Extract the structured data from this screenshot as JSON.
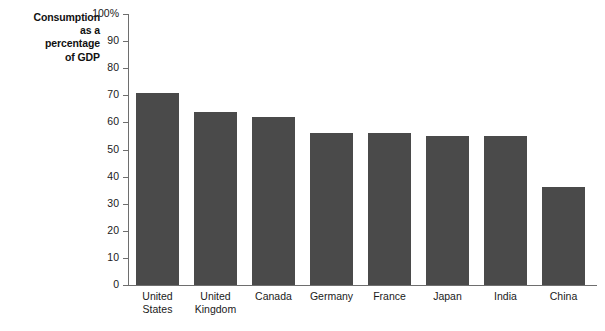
{
  "chart_data": {
    "type": "bar",
    "title": "Consumption as a percentage of GDP",
    "title_lines": [
      "Consumption",
      "as a",
      "percentage",
      "of GDP"
    ],
    "xlabel": "",
    "ylabel": "",
    "ylim": [
      0,
      100
    ],
    "grid": false,
    "legend": "none",
    "bar_color": "#4a4a4a",
    "axis_color": "#6e6e6e",
    "categories": [
      "United States",
      "United Kingdom",
      "Canada",
      "Germany",
      "France",
      "Japan",
      "India",
      "China"
    ],
    "category_lines": [
      [
        "United",
        "States"
      ],
      [
        "United",
        "Kingdom"
      ],
      [
        "Canada"
      ],
      [
        "Germany"
      ],
      [
        "France"
      ],
      [
        "Japan"
      ],
      [
        "India"
      ],
      [
        "China"
      ]
    ],
    "values": [
      71,
      64,
      62,
      56,
      56,
      55,
      55,
      36
    ],
    "yticks": [
      0,
      10,
      20,
      30,
      40,
      50,
      60,
      70,
      80,
      90,
      100
    ],
    "ytick_labels": [
      "0",
      "10",
      "20",
      "30",
      "40",
      "50",
      "60",
      "70",
      "80",
      "90",
      "100%"
    ]
  }
}
